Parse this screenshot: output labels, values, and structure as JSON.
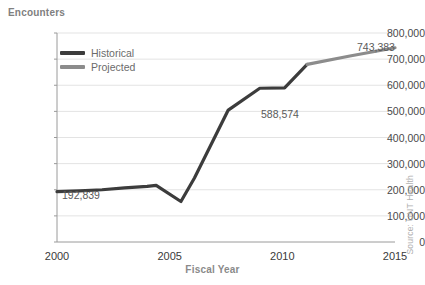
{
  "chart_data": {
    "type": "line",
    "title": "",
    "ylabel": "Encounters",
    "xlabel": "Fiscal Year",
    "xlim": [
      2000,
      2015
    ],
    "ylim": [
      0,
      800000
    ],
    "grid": true,
    "legend_position": "top-left-inside",
    "source": "Source: UNT Health",
    "yticks": [
      "0",
      "100,000",
      "200,000",
      "300,000",
      "400,000",
      "500,000",
      "600,000",
      "700,000",
      "800,000"
    ],
    "ytick_values": [
      0,
      100000,
      200000,
      300000,
      400000,
      500000,
      600000,
      700000,
      800000
    ],
    "xticks": [
      "2000",
      "2005",
      "2010",
      "2015"
    ],
    "xtick_values": [
      2000,
      2005,
      2010,
      2015
    ],
    "series": [
      {
        "name": "Historical",
        "color": "#3c3c3c",
        "x": [
          2000,
          2001,
          2002,
          2003,
          2004,
          2004.4,
          2005.5,
          2006.1,
          2007.6,
          2009.0,
          2010.1,
          2011.1
        ],
        "values": [
          192839,
          196000,
          200000,
          207000,
          213000,
          217000,
          155000,
          245000,
          505000,
          588574,
          590000,
          680000
        ]
      },
      {
        "name": "Projected",
        "color": "#8c8c8c",
        "x": [
          2011.1,
          2013.0,
          2015.0
        ],
        "values": [
          680000,
          712000,
          743383
        ]
      }
    ],
    "annotations": [
      {
        "text": "192,839",
        "x": 2000,
        "value": 192839,
        "px": 62,
        "py": 189
      },
      {
        "text": "588,574",
        "x": 2009.4,
        "value": 588574,
        "px": 261,
        "py": 108
      },
      {
        "text": "743,383",
        "x": 2014.1,
        "value": 743383,
        "px": 357,
        "py": 41
      }
    ]
  },
  "legend": {
    "items": [
      {
        "label": "Historical",
        "color": "#3c3c3c"
      },
      {
        "label": "Projected",
        "color": "#8c8c8c"
      }
    ]
  },
  "colors": {
    "historical": "#3c3c3c",
    "projected": "#8c8c8c",
    "grid": "#e3e3e3",
    "axis": "#9a9a9a",
    "background": "#ffffff"
  }
}
